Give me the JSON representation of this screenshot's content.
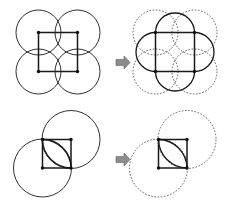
{
  "figure": {
    "width": 226,
    "height": 202,
    "background_color": "#ffffff",
    "stroke_color": "#1a1a1a",
    "dashed_stroke_color": "#3a3a3a",
    "arrow_color": "#8c8c8c",
    "arrow_outline_color": "#6f6f6f",
    "vertex_dot_color": "#111111"
  },
  "rows": [
    {
      "id": "row-top",
      "name": "four-circle-astroid-construction",
      "arrow": {
        "name": "transform-arrow",
        "glyph": "right-block-arrow",
        "x": 116,
        "y": 56
      },
      "before": {
        "id": "panel-top-left",
        "name": "four-circles-with-square",
        "description": "Four mutually tangent circles arranged 2x2 with a solid square joining their centers",
        "circle_style": "solid",
        "circle_radius": 22.5,
        "circles": [
          {
            "name": "circle-top-left",
            "cx": 38.5,
            "cy": 32.5
          },
          {
            "name": "circle-top-right",
            "cx": 77.5,
            "cy": 32.5
          },
          {
            "name": "circle-bottom-left",
            "cx": 38.5,
            "cy": 71.5
          },
          {
            "name": "circle-bottom-right",
            "cx": 77.5,
            "cy": 71.5
          }
        ],
        "square": {
          "name": "center-square",
          "x": 38.5,
          "y": 32.5,
          "size": 39
        },
        "vertices": [
          {
            "x": 38.5,
            "y": 32.5
          },
          {
            "x": 77.5,
            "y": 32.5
          },
          {
            "x": 38.5,
            "y": 71.5
          },
          {
            "x": 77.5,
            "y": 71.5
          }
        ],
        "inner_curves": []
      },
      "after": {
        "id": "panel-top-right",
        "name": "four-dashed-circles-with-astroid",
        "description": "Same four circles drawn dashed; the solid square remains and four concave arcs carve a four-pointed star (astroid) inside it",
        "circle_style": "dashed",
        "circle_radius": 22.5,
        "circles": [
          {
            "name": "circle-top-left",
            "cx": 155.5,
            "cy": 32.5
          },
          {
            "name": "circle-top-right",
            "cx": 194.5,
            "cy": 32.5
          },
          {
            "name": "circle-bottom-left",
            "cx": 155.5,
            "cy": 71.5
          },
          {
            "name": "circle-bottom-right",
            "cx": 194.5,
            "cy": 71.5
          }
        ],
        "square": {
          "name": "center-square",
          "x": 155.5,
          "y": 32.5,
          "size": 39
        },
        "vertices": [
          {
            "x": 155.5,
            "y": 32.5
          },
          {
            "x": 194.5,
            "y": 32.5
          },
          {
            "x": 155.5,
            "y": 71.5
          },
          {
            "x": 194.5,
            "y": 71.5
          }
        ],
        "inner_curves": [
          {
            "name": "astroid-arc-top",
            "from": [
              155.5,
              32.5
            ],
            "to": [
              194.5,
              32.5
            ],
            "radius": 19.5,
            "sweep": 1
          },
          {
            "name": "astroid-arc-right",
            "from": [
              194.5,
              32.5
            ],
            "to": [
              194.5,
              71.5
            ],
            "radius": 19.5,
            "sweep": 1
          },
          {
            "name": "astroid-arc-bottom",
            "from": [
              194.5,
              71.5
            ],
            "to": [
              155.5,
              71.5
            ],
            "radius": 19.5,
            "sweep": 1
          },
          {
            "name": "astroid-arc-left",
            "from": [
              155.5,
              71.5
            ],
            "to": [
              155.5,
              32.5
            ],
            "radius": 19.5,
            "sweep": 1
          }
        ]
      }
    },
    {
      "id": "row-bottom",
      "name": "two-circle-lens-construction",
      "arrow": {
        "name": "transform-arrow",
        "glyph": "right-block-arrow",
        "x": 116,
        "y": 153
      },
      "before": {
        "id": "panel-bottom-left",
        "name": "two-circles-with-square",
        "description": "Two overlapping circles, one upper-right and one lower-left, with a solid square whose opposite corners sit at the two centres",
        "circle_style": "solid",
        "circle_radius": 29,
        "circles": [
          {
            "name": "circle-upper-right",
            "cx": 71.0,
            "cy": 139.5
          },
          {
            "name": "circle-lower-left",
            "cx": 42.5,
            "cy": 168.0
          }
        ],
        "square": {
          "name": "center-square",
          "x": 42.5,
          "y": 139.5,
          "size": 28.5
        },
        "vertices": [
          {
            "x": 42.5,
            "y": 139.5
          },
          {
            "x": 71.0,
            "y": 139.5
          },
          {
            "x": 42.5,
            "y": 168.0
          },
          {
            "x": 71.0,
            "y": 168.0
          }
        ],
        "inner_curves": [
          {
            "name": "lens-arc-upper",
            "from": [
              42.5,
              139.5
            ],
            "to": [
              71.0,
              168.0
            ],
            "radius": 29,
            "sweep": 1
          },
          {
            "name": "lens-arc-lower",
            "from": [
              42.5,
              139.5
            ],
            "to": [
              71.0,
              168.0
            ],
            "radius": 29,
            "sweep": 0
          }
        ]
      },
      "after": {
        "id": "panel-bottom-right",
        "name": "two-dashed-circles-with-lens",
        "description": "Same two circles drawn dashed; the solid square remains and two arcs form a pointed lens (vesica) leaf inside it",
        "circle_style": "dashed",
        "circle_radius": 29,
        "circles": [
          {
            "name": "circle-upper-right",
            "cx": 187.0,
            "cy": 139.5
          },
          {
            "name": "circle-lower-left",
            "cx": 158.5,
            "cy": 168.0
          }
        ],
        "square": {
          "name": "center-square",
          "x": 158.5,
          "y": 139.5,
          "size": 28.5
        },
        "vertices": [
          {
            "x": 158.5,
            "y": 139.5
          },
          {
            "x": 187.0,
            "y": 139.5
          },
          {
            "x": 158.5,
            "y": 168.0
          },
          {
            "x": 187.0,
            "y": 168.0
          }
        ],
        "inner_curves": [
          {
            "name": "lens-arc-upper",
            "from": [
              158.5,
              139.5
            ],
            "to": [
              187.0,
              168.0
            ],
            "radius": 29,
            "sweep": 1
          },
          {
            "name": "lens-arc-lower",
            "from": [
              158.5,
              139.5
            ],
            "to": [
              187.0,
              168.0
            ],
            "radius": 29,
            "sweep": 0
          }
        ]
      }
    }
  ]
}
